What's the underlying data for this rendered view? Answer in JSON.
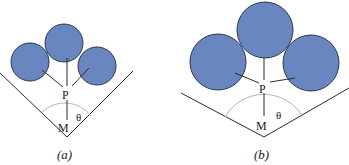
{
  "colors": {
    "circle_fill": "#6a86c0",
    "circle_stroke": "#2a3550",
    "line": "#2b2b2b",
    "arc": "#aab6c8"
  },
  "panels": [
    {
      "id": "a",
      "caption": "(a)",
      "labels": {
        "point_p": "P",
        "point_m": "M",
        "angle": "θ"
      }
    },
    {
      "id": "b",
      "caption": "(b)",
      "labels": {
        "point_p": "P",
        "point_m": "M",
        "angle": "θ"
      }
    }
  ]
}
